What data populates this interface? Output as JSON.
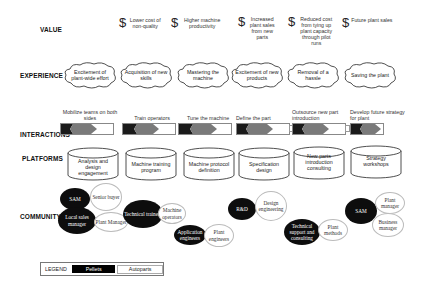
{
  "rows": {
    "value": "VALUE",
    "experience": "EXPERIENCE",
    "interactions": "INTERACTIONS",
    "platforms": "PLATFORMS",
    "community": "COMMUNITY"
  },
  "value": [
    {
      "icon": "dollar-icon",
      "symbol": "$",
      "text": "Lower cost of non-quality"
    },
    {
      "icon": "dollar-icon",
      "symbol": "$",
      "text": "Higher machine productivity"
    },
    {
      "icon": "dollar-icon",
      "symbol": "$",
      "text": "Increased plant sales from new parts"
    },
    {
      "icon": "dollar-icon",
      "symbol": "$",
      "text": "Reduced cost from tying up plant capacity through pilot runs"
    },
    {
      "icon": "dollar-icon",
      "symbol": "$",
      "text": "Future plant sales"
    }
  ],
  "experience": [
    {
      "text": "Excitement of plant-wide effort"
    },
    {
      "text": "Acquisition of new skills"
    },
    {
      "text": "Mastering the machine"
    },
    {
      "text": "Excitement of new products"
    },
    {
      "text": "Removal of a hassle"
    },
    {
      "text": "Saving the plant"
    }
  ],
  "interactions": [
    {
      "text": "Mobilize teams on both sides",
      "has_endcap": false
    },
    {
      "text": "Train operators",
      "has_endcap": false
    },
    {
      "text": "Tune the machine",
      "has_endcap": false
    },
    {
      "text": "Define the part",
      "has_endcap": true
    },
    {
      "text": "Outsource new part introduction",
      "has_endcap": true
    },
    {
      "text": "Develop future strategy for plant",
      "has_endcap": false
    }
  ],
  "platforms": [
    {
      "text": "Analysis and design engagement"
    },
    {
      "text": "Machine training program"
    },
    {
      "text": "Machine protocol definition"
    },
    {
      "text": "Specification design"
    },
    {
      "text": "New parts introduction consulting"
    },
    {
      "text": "Strategy workshops"
    }
  ],
  "community": {
    "group1": {
      "sam": "SAM",
      "senior_buyer": "Senior buyer",
      "local_sales": "Local sales manager",
      "plant_manager": "Plant Manager"
    },
    "group2": {
      "tech_trainers": "Technical trainers",
      "machine_operators": "Machine operators"
    },
    "group3": {
      "app_engineers": "Application engineers",
      "plant_engineers": "Plant engineers"
    },
    "group4": {
      "rnd": "R&D",
      "design_eng": "Design engineering"
    },
    "group5": {
      "tech_support": "Technical support and consulting",
      "plant_methods": "Plant methods"
    },
    "group6": {
      "sam": "SAM",
      "plant_manager": "Plant manager",
      "business_manager": "Business manager"
    }
  },
  "legend": {
    "label": "LEGEND",
    "dark": "Pellets",
    "light": "Autoparts"
  },
  "colors": {
    "dark": "#0d0d0d",
    "bar_dark": "#1a1a1a",
    "bar_mid": "#7a7a7a",
    "outline": "#333333"
  }
}
